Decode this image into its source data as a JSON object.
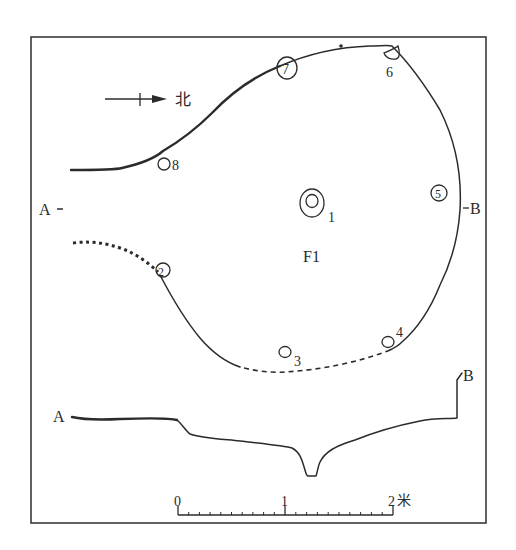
{
  "figure": {
    "feature_label": "F1",
    "north_arrow": {
      "label": "北"
    },
    "section_markers": {
      "plan_a": "A",
      "plan_b": "B",
      "profile_a": "A",
      "profile_b": "B"
    },
    "postholes": [
      {
        "id": "1",
        "label": "1"
      },
      {
        "id": "2",
        "label": "2"
      },
      {
        "id": "3",
        "label": "3"
      },
      {
        "id": "4",
        "label": "4"
      },
      {
        "id": "5",
        "label": "5"
      },
      {
        "id": "6",
        "label": "6"
      },
      {
        "id": "7",
        "label": "7"
      },
      {
        "id": "8",
        "label": "8"
      }
    ],
    "scale_bar": {
      "ticks": [
        "0",
        "1",
        "2"
      ],
      "unit": "米",
      "minor_divisions_per_unit": 10
    }
  },
  "colors": {
    "ink": "#2b2b2b",
    "background": "#ffffff"
  }
}
